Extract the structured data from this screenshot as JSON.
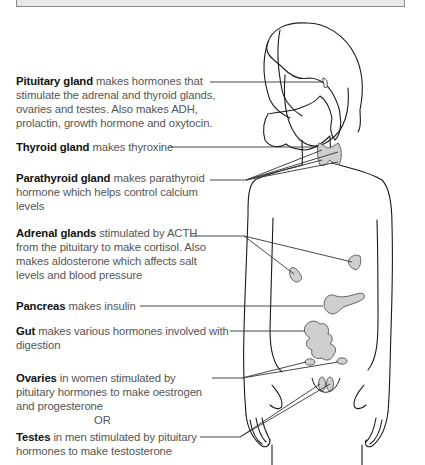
{
  "diagram": {
    "type": "annotated anatomical figure",
    "colors": {
      "organ_fill": "#cfcfcf",
      "outline": "#1a1a1a",
      "leader_line": "#333333",
      "header_box": "#e9e9e9",
      "bold_text": "#111111",
      "body_text": "#555555"
    },
    "labels": [
      {
        "id": "pituitary",
        "name": "Pituitary gland",
        "text": " makes hormones that stimulate the adrenal and thyroid glands, ovaries and testes. Also makes ADH, prolactin, growth hormone and oxytocin."
      },
      {
        "id": "thyroid",
        "name": "Thyroid gland",
        "text": " makes thyroxine"
      },
      {
        "id": "parathyroid",
        "name": "Parathyroid gland",
        "text": " makes parathyroid hormone which helps control calcium levels"
      },
      {
        "id": "adrenal",
        "name": "Adrenal glands",
        "text": " stimulated by ACTH from the pituitary to make cortisol. Also makes aldosterone which affects salt levels and blood pressure"
      },
      {
        "id": "pancreas",
        "name": "Pancreas",
        "text": " makes insulin"
      },
      {
        "id": "gut",
        "name": "Gut",
        "text": " makes various hormones involved with digestion"
      },
      {
        "id": "ovaries",
        "name": "Ovaries",
        "text": " in women stimulated by pituitary hormones to make oestrogen and progesterone"
      },
      {
        "id": "testes",
        "name": "Testes",
        "text": " in men stimulated by pituitary hormones to make testosterone"
      }
    ],
    "separator": "OR"
  }
}
